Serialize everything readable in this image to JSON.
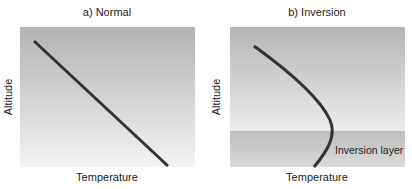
{
  "panels": [
    {
      "title": "a) Normal",
      "xlabel": "Temperature",
      "ylabel": "Altitude"
    },
    {
      "title": "b) Inversion",
      "xlabel": "Temperature",
      "ylabel": "Altitude",
      "layer_label": "Inversion layer"
    }
  ],
  "colors": {
    "bg_top": "#b5b5b5",
    "bg_bottom": "#f2f2f2",
    "inversion_top": "#c2c2c2",
    "inversion_bottom": "#d8d8d8",
    "line": "#333333"
  }
}
